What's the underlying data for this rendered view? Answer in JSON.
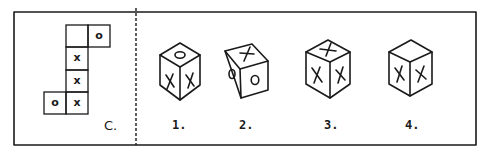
{
  "figure": {
    "net": {
      "label": "C.",
      "cells": [
        {
          "row": 0,
          "col": 1,
          "mark": ""
        },
        {
          "row": 0,
          "col": 2,
          "mark": "o"
        },
        {
          "row": 1,
          "col": 1,
          "mark": "x"
        },
        {
          "row": 2,
          "col": 1,
          "mark": "x"
        },
        {
          "row": 3,
          "col": 0,
          "mark": "o"
        },
        {
          "row": 3,
          "col": 1,
          "mark": "x"
        }
      ]
    },
    "options": [
      {
        "label": "1.",
        "top": "O",
        "left": "X",
        "right": "X"
      },
      {
        "label": "2.",
        "top": "X",
        "left": "O",
        "right": "O"
      },
      {
        "label": "3.",
        "top": "X",
        "left": "X",
        "right": "X"
      },
      {
        "label": "4.",
        "top": "",
        "left": "X",
        "right": "X"
      }
    ]
  }
}
